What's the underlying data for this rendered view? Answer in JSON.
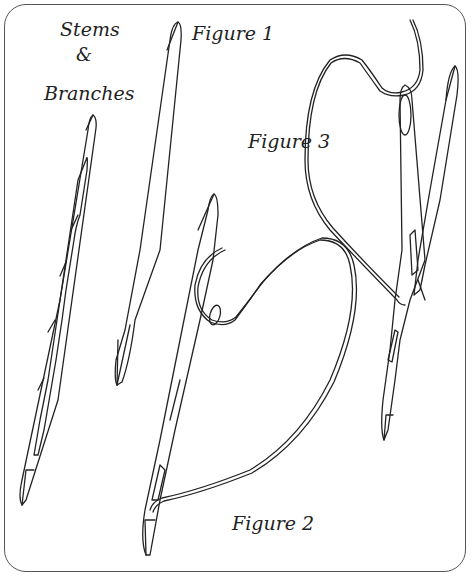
{
  "title": {
    "line1": "Stems",
    "line2": "&",
    "line3": "Branches"
  },
  "figures": [
    {
      "id": "figure-1",
      "label": "Figure 1"
    },
    {
      "id": "figure-2",
      "label": "Figure 2"
    },
    {
      "id": "figure-3",
      "label": "Figure 3"
    }
  ],
  "colors": {
    "ink": "#222222",
    "frame": "#555555",
    "background": "#ffffff"
  }
}
